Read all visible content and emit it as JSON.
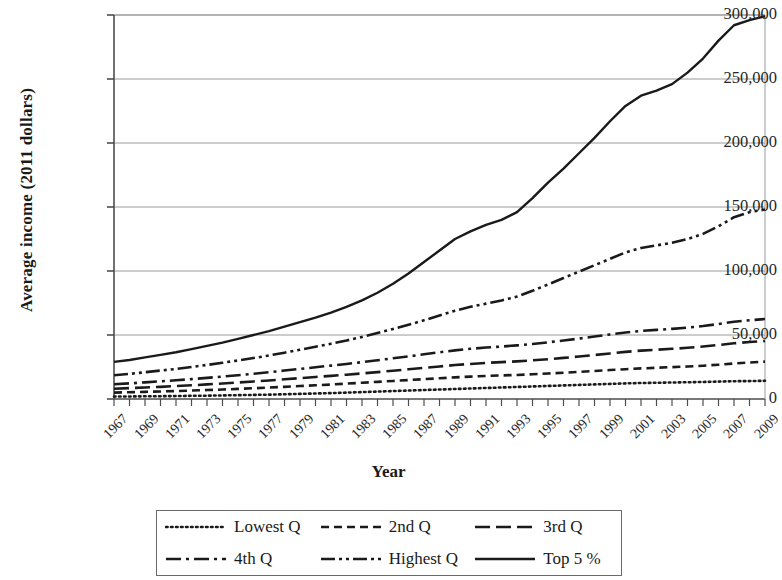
{
  "chart_data": {
    "type": "line",
    "title": "",
    "xlabel": "Year",
    "ylabel": "Average income (2011 dollars)",
    "xlim": [
      1967,
      2009
    ],
    "ylim": [
      0,
      300000
    ],
    "ytick_labels": [
      "0",
      "50,000",
      "100,000",
      "150,000",
      "200,000",
      "250,000",
      "300,000"
    ],
    "ytick_values": [
      0,
      50000,
      100000,
      150000,
      200000,
      250000,
      300000
    ],
    "grid": "horizontal",
    "legend_position": "bottom",
    "x": [
      1967,
      1968,
      1969,
      1970,
      1971,
      1972,
      1973,
      1974,
      1975,
      1976,
      1977,
      1978,
      1979,
      1980,
      1981,
      1982,
      1983,
      1984,
      1985,
      1986,
      1987,
      1988,
      1989,
      1990,
      1991,
      1992,
      1993,
      1994,
      1995,
      1996,
      1997,
      1998,
      1999,
      2000,
      2001,
      2002,
      2003,
      2004,
      2005,
      2006,
      2007,
      2008,
      2009
    ],
    "xtick_labels": [
      "1967",
      "1969",
      "1971",
      "1973",
      "1975",
      "1977",
      "1979",
      "1981",
      "1983",
      "1985",
      "1987",
      "1989",
      "1991",
      "1993",
      "1995",
      "1997",
      "1999",
      "2001",
      "2003",
      "2005",
      "2007",
      "2009"
    ],
    "series": [
      {
        "name": "Lowest Q",
        "dash": "dotted",
        "values": [
          1900,
          2000,
          2100,
          2200,
          2300,
          2500,
          2600,
          2800,
          3000,
          3200,
          3400,
          3700,
          4000,
          4300,
          4600,
          5000,
          5400,
          5800,
          6200,
          6600,
          7000,
          7400,
          7800,
          8200,
          8600,
          9000,
          9400,
          9800,
          10200,
          10600,
          11000,
          11400,
          11800,
          12200,
          12500,
          12700,
          12900,
          13100,
          13300,
          13600,
          13900,
          14000,
          14200
        ]
      },
      {
        "name": "2nd Q",
        "dash": "dashed-short",
        "values": [
          5000,
          5300,
          5600,
          5900,
          6200,
          6600,
          7000,
          7400,
          7900,
          8400,
          8900,
          9500,
          10100,
          10700,
          11300,
          12000,
          12700,
          13400,
          14100,
          14800,
          15500,
          16200,
          16900,
          17500,
          18000,
          18400,
          18800,
          19300,
          19900,
          20500,
          21200,
          21900,
          22600,
          23300,
          23900,
          24400,
          24900,
          25400,
          26000,
          26800,
          27700,
          28500,
          29200
        ]
      },
      {
        "name": "3rd Q",
        "dash": "dashed-long",
        "values": [
          8000,
          8500,
          9000,
          9500,
          10100,
          10700,
          11400,
          12100,
          12900,
          13700,
          14500,
          15400,
          16300,
          17200,
          18100,
          19000,
          20000,
          21000,
          22100,
          23200,
          24300,
          25400,
          26500,
          27400,
          28200,
          28800,
          29400,
          30200,
          31100,
          32100,
          33200,
          34400,
          35600,
          36800,
          37800,
          38500,
          39200,
          40000,
          41000,
          42200,
          43500,
          44500,
          45300
        ]
      },
      {
        "name": "4th Q",
        "dash": "dash-dot",
        "values": [
          11500,
          12200,
          13000,
          13800,
          14600,
          15500,
          16500,
          17500,
          18600,
          19700,
          20900,
          22200,
          23500,
          24800,
          26100,
          27400,
          28800,
          30300,
          31800,
          33300,
          34900,
          36500,
          38000,
          39200,
          40200,
          41000,
          41900,
          43000,
          44300,
          45700,
          47200,
          48800,
          50400,
          52000,
          53200,
          54000,
          54800,
          55800,
          57000,
          58600,
          60300,
          61500,
          62500
        ]
      },
      {
        "name": "Highest Q",
        "dash": "dash-dot-dot",
        "values": [
          18500,
          19600,
          20900,
          22200,
          23500,
          25000,
          26600,
          28300,
          30100,
          32000,
          34000,
          36200,
          38500,
          40800,
          43200,
          45700,
          48500,
          51500,
          54700,
          58000,
          61500,
          65200,
          69000,
          72000,
          74500,
          77000,
          80000,
          84500,
          89500,
          94500,
          99500,
          104500,
          109500,
          114500,
          118000,
          120000,
          122000,
          125000,
          129000,
          135000,
          142000,
          146000,
          148000
        ]
      },
      {
        "name": "Top 5 %",
        "dash": "solid",
        "values": [
          29000,
          30500,
          32500,
          34500,
          36500,
          39000,
          41500,
          44000,
          47000,
          50000,
          53000,
          56500,
          60000,
          63500,
          67500,
          72000,
          77000,
          83000,
          90000,
          98000,
          107000,
          116000,
          125000,
          131000,
          136000,
          140000,
          146000,
          157000,
          169000,
          180000,
          192000,
          204000,
          217000,
          229000,
          237000,
          241000,
          246000,
          255000,
          266000,
          280000,
          292000,
          296000,
          299000
        ]
      }
    ]
  },
  "axes": {
    "ylabel": "Average income (2011 dollars)",
    "xlabel": "Year"
  },
  "legend": {
    "entries": [
      {
        "label": "Lowest Q",
        "style": "dotted"
      },
      {
        "label": "2nd Q",
        "style": "dashed-short"
      },
      {
        "label": "3rd Q",
        "style": "dashed-long"
      },
      {
        "label": "4th Q",
        "style": "dash-dot"
      },
      {
        "label": "Highest Q",
        "style": "dash-dot-dot"
      },
      {
        "label": "Top 5 %",
        "style": "solid"
      }
    ]
  },
  "colors": {
    "line": "#1a1a1a",
    "grid": "#9a9a9a",
    "axis": "#4d4d4d",
    "text": "#1a1a1a"
  }
}
